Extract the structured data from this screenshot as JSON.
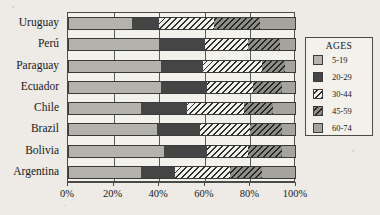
{
  "chart_data": {
    "type": "bar",
    "orientation": "horizontal",
    "stacked": true,
    "normalized_percent": true,
    "title": "",
    "subtitle": "",
    "xlabel": "",
    "ylabel": "",
    "xlim": [
      0,
      100
    ],
    "xticks": [
      "0%",
      "20%",
      "40%",
      "60%",
      "80%",
      "100%"
    ],
    "xtick_values": [
      0,
      20,
      40,
      60,
      80,
      100
    ],
    "grid": true,
    "grid_axis": "x",
    "legend_title": "AGES",
    "legend_position": "right",
    "series": [
      {
        "name": "5-19",
        "fill": "solid-light-gray",
        "color": "#b4b2ad",
        "values": [
          28,
          40,
          41,
          41,
          32,
          39,
          42,
          32
        ]
      },
      {
        "name": "20-29",
        "fill": "solid-dark",
        "color": "#454545",
        "values": [
          12,
          20,
          18,
          20,
          20,
          19,
          19,
          15
        ]
      },
      {
        "name": "30-44",
        "fill": "light-diagonal-hatch",
        "color": "#f2f0ea",
        "values": [
          24,
          19,
          26,
          20,
          25,
          22,
          18,
          24
        ]
      },
      {
        "name": "45-59",
        "fill": "dark-diagonal-hatch",
        "color": "#8f8d88",
        "values": [
          20,
          14,
          10,
          13,
          13,
          14,
          15,
          14
        ]
      },
      {
        "name": "60-74",
        "fill": "solid-mid-gray",
        "color": "#a5a39e",
        "values": [
          16,
          7,
          5,
          6,
          10,
          6,
          6,
          15
        ]
      }
    ],
    "categories": [
      "Uruguay",
      "Perú",
      "Paraguay",
      "Ecuador",
      "Chile",
      "Brazil",
      "Bolivia",
      "Argentina"
    ]
  },
  "legend": {
    "title": "AGES",
    "items": [
      {
        "label": "5-19"
      },
      {
        "label": "20-29"
      },
      {
        "label": "30-44"
      },
      {
        "label": "45-59"
      },
      {
        "label": "60-74"
      }
    ]
  }
}
